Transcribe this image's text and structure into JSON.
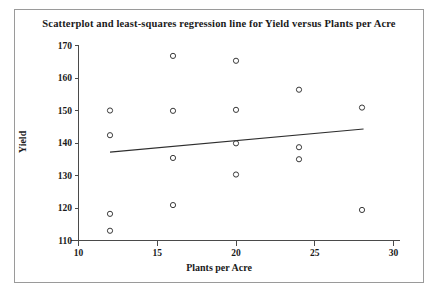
{
  "chart_data": {
    "type": "scatter",
    "title": "Scatterplot and least-squares regression line for Yield versus Plants per Acre",
    "xlabel": "Plants per Acre",
    "ylabel": "Yield",
    "xlim": [
      10,
      30
    ],
    "ylim": [
      110,
      170
    ],
    "xticks": [
      10,
      15,
      20,
      25,
      30
    ],
    "yticks": [
      110,
      120,
      130,
      140,
      150,
      160,
      170
    ],
    "xtick_labels": [
      "10",
      "15",
      "20",
      "25",
      "30"
    ],
    "ytick_labels": [
      "110",
      "120",
      "130",
      "140",
      "150",
      "160",
      "170"
    ],
    "grid": false,
    "legend": "none",
    "marker": "open-circle",
    "marker_color": "#3a3a3a",
    "line_color": "#2e2e2e",
    "points": [
      {
        "x": 12,
        "y": 150.0
      },
      {
        "x": 12,
        "y": 142.4
      },
      {
        "x": 12,
        "y": 118.2
      },
      {
        "x": 12,
        "y": 113.0
      },
      {
        "x": 16,
        "y": 166.8
      },
      {
        "x": 16,
        "y": 149.9
      },
      {
        "x": 16,
        "y": 135.4
      },
      {
        "x": 16,
        "y": 120.9
      },
      {
        "x": 20,
        "y": 165.3
      },
      {
        "x": 20,
        "y": 150.2
      },
      {
        "x": 20,
        "y": 139.9
      },
      {
        "x": 20,
        "y": 130.3
      },
      {
        "x": 24,
        "y": 156.4
      },
      {
        "x": 24,
        "y": 138.7
      },
      {
        "x": 24,
        "y": 135.0
      },
      {
        "x": 28,
        "y": 150.9
      },
      {
        "x": 28,
        "y": 119.4
      }
    ],
    "regression_line": {
      "x_start": 12.0,
      "y_start": 137.2,
      "x_end": 28.1,
      "y_end": 144.3
    }
  }
}
